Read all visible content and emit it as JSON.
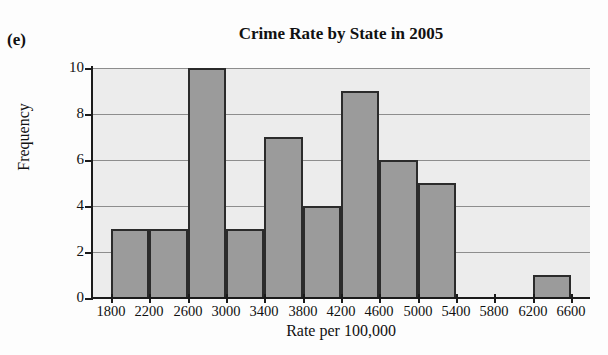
{
  "panel": {
    "label": "(e)"
  },
  "chart_data": {
    "type": "bar",
    "title": "Crime Rate by State in 2005",
    "xlabel": "Rate per 100,000",
    "ylabel": "Frequency",
    "xlim": [
      1600,
      6800
    ],
    "ylim": [
      0,
      10
    ],
    "bin_width": 400,
    "grid": true,
    "legend": null,
    "x_tick_labels": [
      "1800",
      "2200",
      "2600",
      "3000",
      "3400",
      "3800",
      "4200",
      "4600",
      "5000",
      "5400",
      "5800",
      "6200",
      "6600"
    ],
    "x_tick_values": [
      1800,
      2200,
      2600,
      3000,
      3400,
      3800,
      4200,
      4600,
      5000,
      5400,
      5800,
      6200,
      6600
    ],
    "y_tick_labels": [
      "0",
      "2",
      "4",
      "6",
      "8",
      "10"
    ],
    "y_tick_values": [
      0,
      2,
      4,
      6,
      8,
      10
    ],
    "bins": [
      {
        "start": 1800,
        "end": 2200,
        "frequency": 3
      },
      {
        "start": 2200,
        "end": 2600,
        "frequency": 3
      },
      {
        "start": 2600,
        "end": 3000,
        "frequency": 10
      },
      {
        "start": 3000,
        "end": 3400,
        "frequency": 3
      },
      {
        "start": 3400,
        "end": 3800,
        "frequency": 7
      },
      {
        "start": 3800,
        "end": 4200,
        "frequency": 4
      },
      {
        "start": 4200,
        "end": 4600,
        "frequency": 9
      },
      {
        "start": 4600,
        "end": 5000,
        "frequency": 6
      },
      {
        "start": 5000,
        "end": 5400,
        "frequency": 5
      },
      {
        "start": 5400,
        "end": 5800,
        "frequency": 0
      },
      {
        "start": 5800,
        "end": 6200,
        "frequency": 0
      },
      {
        "start": 6200,
        "end": 6600,
        "frequency": 1
      }
    ],
    "categories": [
      "1800-2200",
      "2200-2600",
      "2600-3000",
      "3000-3400",
      "3400-3800",
      "3800-4200",
      "4200-4600",
      "4600-5000",
      "5000-5400",
      "5400-5800",
      "5800-6200",
      "6200-6600"
    ],
    "values": [
      3,
      3,
      10,
      3,
      7,
      4,
      9,
      6,
      5,
      0,
      0,
      1
    ],
    "colors": {
      "bar_fill": "#9b9b9b",
      "bar_edge": "#2b2b2b",
      "plot_background": "#ececec",
      "gridline": "#8d8d8d",
      "axis": "#1b1b1b",
      "text": "#111111"
    }
  }
}
